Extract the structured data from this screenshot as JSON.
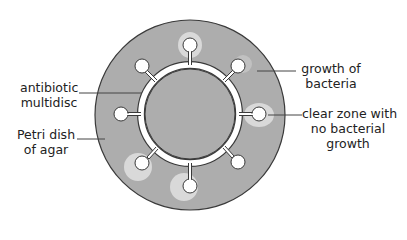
{
  "diagram": {
    "title": "",
    "colors": {
      "agar": "#adadad",
      "dish_outline": "#3a3a3a",
      "disc_fill": "#ffffff",
      "clear_zone": "#e2e2e2",
      "leader_line": "#444444",
      "text": "#222222"
    },
    "dish": {
      "cx": 190,
      "cy": 115,
      "r": 95
    },
    "multidisc": {
      "cx": 190,
      "cy": 114,
      "r_inner": 46,
      "ring_width": 5
    },
    "discs": [
      {
        "angle": -90,
        "clear_zone": true
      },
      {
        "angle": -45,
        "clear_zone": false
      },
      {
        "angle": 0,
        "clear_zone": true
      },
      {
        "angle": 45,
        "clear_zone": false
      },
      {
        "angle": 90,
        "clear_zone": true
      },
      {
        "angle": 135,
        "clear_zone": true
      },
      {
        "angle": 180,
        "clear_zone": false
      },
      {
        "angle": 225,
        "clear_zone": false
      }
    ],
    "labels": {
      "antibiotic_multidisc": {
        "line1": "antibiotic",
        "line2": "multidisc"
      },
      "petri_dish": {
        "line1": "Petri dish",
        "line2": "of agar"
      },
      "growth_of_bacteria": {
        "line1": "growth of",
        "line2": "bacteria"
      },
      "clear_zone": {
        "line1": "clear zone with",
        "line2": "no bacterial",
        "line3": "growth"
      }
    }
  }
}
